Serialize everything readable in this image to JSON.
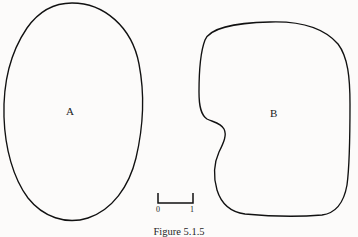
{
  "figure": {
    "caption": "Figure 5.1.5",
    "background_color": "#fcfbfa",
    "ink_color": "#111111",
    "width": 358,
    "height": 237
  },
  "regions": [
    {
      "id": "A",
      "label": "A",
      "description": "tall smooth oval region"
    },
    {
      "id": "B",
      "label": "B",
      "description": "rounded blob region with concave notch on its left side"
    }
  ],
  "scale_bar": {
    "start_label": "0",
    "end_label": "1",
    "description": "bracket-style scale rule with upward end ticks"
  },
  "labels": {
    "region_a": "A",
    "region_b": "B"
  }
}
